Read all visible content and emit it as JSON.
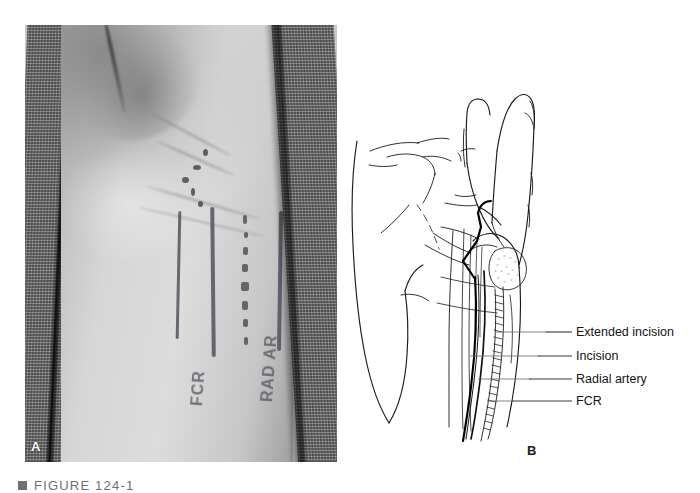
{
  "figure": {
    "caption_marker": "■",
    "caption_text": "FIGURE 124-1",
    "panel_a_letter": "A",
    "panel_b_letter": "B"
  },
  "panel_a": {
    "kind": "clinical-photograph",
    "description": "Volar wrist prepared and draped with surgical skin markings",
    "skin_ink_labels": [
      {
        "text": "FCR",
        "rotation_deg": -86
      },
      {
        "text": "RAD AR",
        "rotation_deg": -86
      }
    ],
    "colors": {
      "drape": "#8d8d8d",
      "skin_light": "#dcdcdc",
      "skin_shadow": "#9e9e9e",
      "ink": "#4b4f58"
    }
  },
  "panel_b": {
    "kind": "line-drawing",
    "description": "Line drawing of hand and volar wrist showing incision, extended incision, radial artery and FCR tendon",
    "labels": [
      {
        "id": "extended-incision",
        "text": "Extended incision",
        "top": 326,
        "leader_x1": 546,
        "leader_x2": 572,
        "leader_y": 332
      },
      {
        "id": "incision",
        "text": "Incision",
        "top": 350,
        "leader_x1": 538,
        "leader_x2": 572,
        "leader_y": 356
      },
      {
        "id": "radial-artery",
        "text": "Radial artery",
        "top": 373,
        "leader_x1": 529,
        "leader_x2": 572,
        "leader_y": 379
      },
      {
        "id": "fcr",
        "text": "FCR",
        "top": 395,
        "leader_x1": 512,
        "leader_x2": 572,
        "leader_y": 401
      }
    ],
    "colors": {
      "ink": "#1a1a1a",
      "leader": "#3a3a3a",
      "background": "#ffffff"
    }
  }
}
